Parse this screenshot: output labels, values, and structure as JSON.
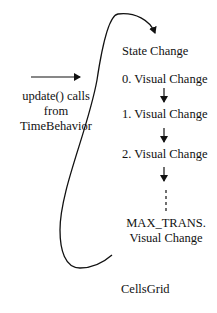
{
  "diagram": {
    "input": {
      "line1": "update() calls",
      "line2": "from",
      "line3": "TimeBehavior"
    },
    "steps": [
      {
        "label": "State Change"
      },
      {
        "label": "0. Visual Change"
      },
      {
        "label": "1. Visual Change"
      },
      {
        "label": "2. Visual Change"
      },
      {
        "label_line1": "MAX_TRANS.",
        "label_line2": "Visual Change"
      }
    ],
    "container_label": "CellsGrid",
    "colors": {
      "stroke": "#111111",
      "background": "#ffffff"
    }
  }
}
